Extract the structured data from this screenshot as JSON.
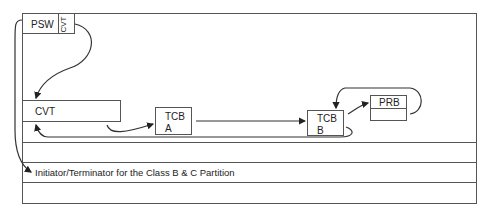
{
  "diagram": {
    "psw": {
      "label": "PSW",
      "pointer_label": "CVT"
    },
    "cvt": {
      "label": "CVT"
    },
    "tcb_a": {
      "line1": "TCB",
      "line2": "A"
    },
    "tcb_b": {
      "line1": "TCB",
      "line2": "B"
    },
    "prb": {
      "label": "PRB"
    },
    "partition_row": {
      "label": "Initiator/Terminator for the Class B & C Partition"
    },
    "colors": {
      "line": "#555555",
      "arrow": "#222222",
      "background": "#ffffff"
    }
  }
}
